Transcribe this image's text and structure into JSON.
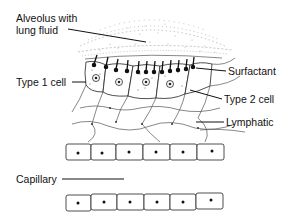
{
  "diagram": {
    "labels": {
      "alveolus": [
        "Alveolus with",
        "lung fluid"
      ],
      "surfactant": "Surfactant",
      "type1": "Type 1 cell",
      "type2": "Type 2 cell",
      "lymphatic": "Lymphatic",
      "capillary": "Capillary"
    },
    "colors": {
      "ink": "#111111",
      "light_ink": "#8a8a8a",
      "background": "#ffffff"
    }
  }
}
